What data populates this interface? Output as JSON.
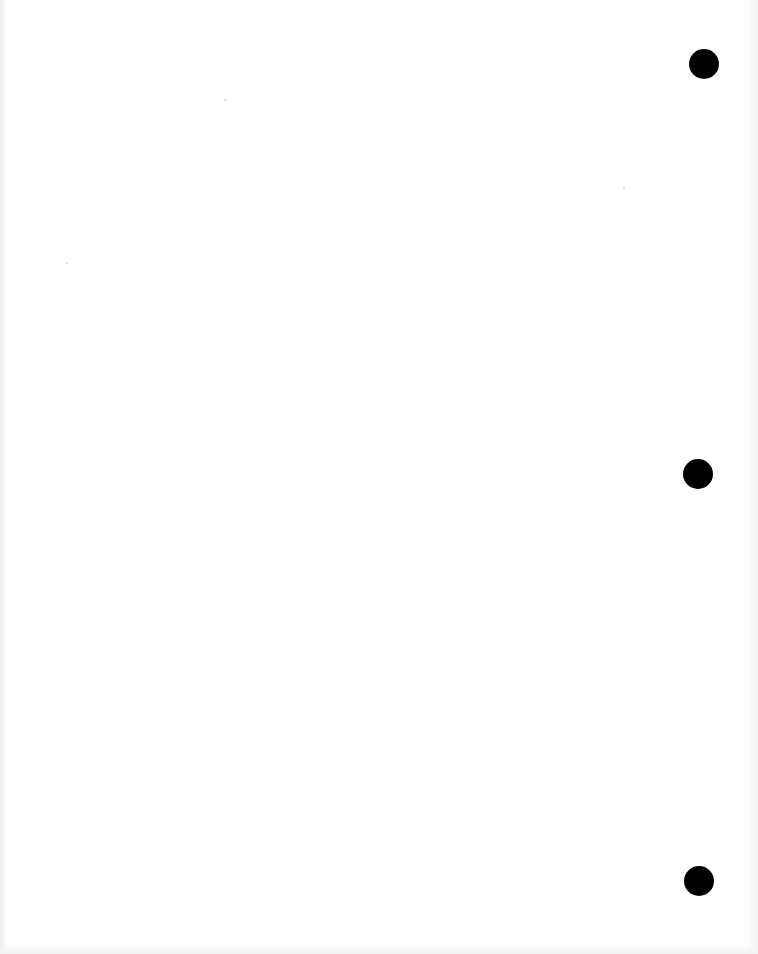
{
  "page": {
    "type": "blank scanned sheet",
    "background_color": "#fefefe",
    "text": ""
  },
  "punch_holes": [
    {
      "cx": 704,
      "cy": 64,
      "r": 15,
      "color": "#000000"
    },
    {
      "cx": 698,
      "cy": 474,
      "r": 15,
      "color": "#000000"
    },
    {
      "cx": 699,
      "cy": 881,
      "r": 15,
      "color": "#000000"
    }
  ]
}
